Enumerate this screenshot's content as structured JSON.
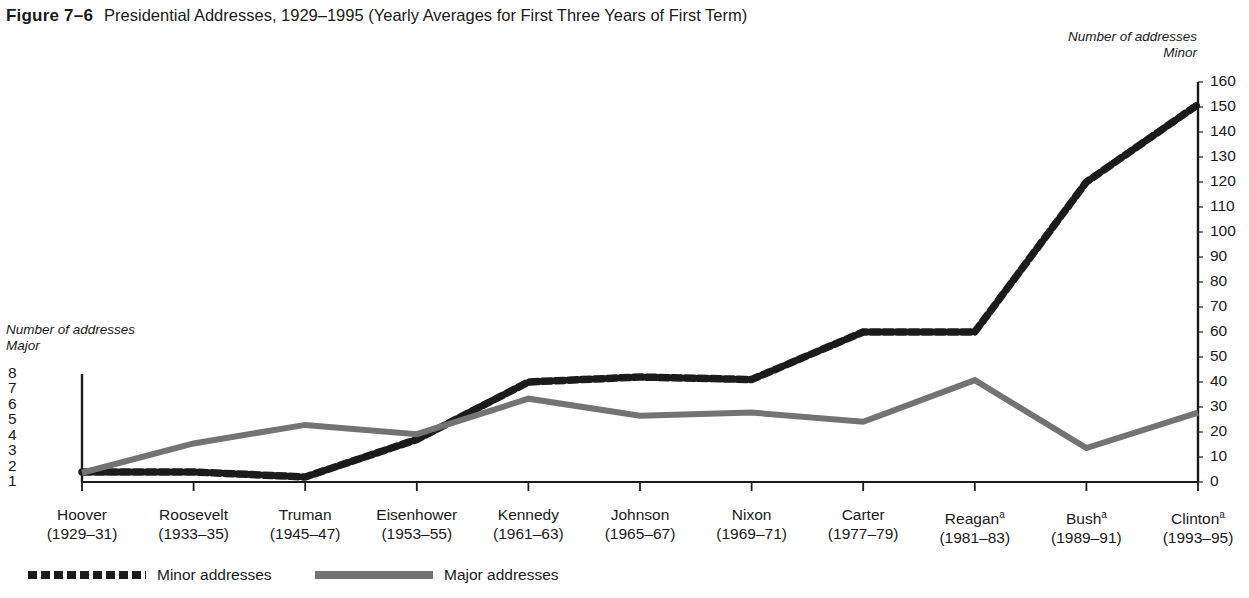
{
  "figure": {
    "number": "Figure 7–6",
    "title": "Presidential Addresses, 1929–1995 (Yearly Averages for First Three Years of First Term)"
  },
  "axis_captions": {
    "left_line1": "Number of addresses",
    "left_line2": "Major",
    "right_line1": "Number of addresses",
    "right_line2": "Minor"
  },
  "legend": {
    "minor_label": "Minor addresses",
    "major_label": "Major addresses",
    "minor_key": "dotted-line-key",
    "major_key": "solid-line-key"
  },
  "colors": {
    "minor_line": "#1b1b1b",
    "major_line": "#737373",
    "axis": "#1a1a1a",
    "background": "#ffffff"
  },
  "chart_data": {
    "type": "line",
    "title": "Presidential Addresses, 1929–1995 (Yearly Averages for First Three Years of First Term)",
    "xlabel": "",
    "ylabel": "Number of addresses — Major",
    "y2label": "Number of addresses — Minor",
    "grid": false,
    "legend_position": "bottom-left",
    "categories": [
      "Hoover",
      "Roosevelt",
      "Truman",
      "Eisenhower",
      "Kennedy",
      "Johnson",
      "Nixon",
      "Carter",
      "Reagan",
      "Bush",
      "Clinton"
    ],
    "category_years": [
      "(1929–31)",
      "(1933–35)",
      "(1945–47)",
      "(1953–55)",
      "(1961–63)",
      "(1965–67)",
      "(1969–71)",
      "(1977–79)",
      "(1981–83)",
      "(1989–91)",
      "(1993–95)"
    ],
    "category_footnote_marks": [
      "",
      "",
      "",
      "",
      "",
      "",
      "",
      "",
      "a",
      "a",
      "a"
    ],
    "ylim": [
      1,
      8
    ],
    "yticks": [
      8,
      7,
      6,
      5,
      4,
      3,
      2,
      1
    ],
    "y2lim": [
      0,
      160
    ],
    "y2ticks": [
      160,
      150,
      140,
      130,
      120,
      110,
      100,
      90,
      80,
      70,
      60,
      50,
      40,
      30,
      20,
      10,
      0
    ],
    "series": [
      {
        "name": "Minor addresses",
        "axis": "right",
        "style": "dotted",
        "color": "#1b1b1b",
        "values": [
          4,
          4,
          2,
          17,
          40,
          42,
          41,
          60,
          60,
          120,
          151
        ]
      },
      {
        "name": "Major addresses",
        "axis": "left",
        "style": "solid",
        "color": "#737373",
        "values": [
          1.6,
          3.5,
          4.7,
          4.1,
          6.4,
          5.3,
          5.5,
          4.9,
          7.6,
          3.2,
          5.5
        ]
      }
    ]
  }
}
